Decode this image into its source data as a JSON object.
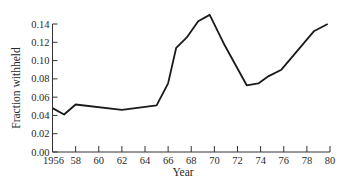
{
  "chart_data": {
    "type": "line",
    "title": "",
    "xlabel": "Year",
    "ylabel": "Fraction withheld",
    "xlim": [
      1956,
      1980
    ],
    "ylim": [
      0.0,
      0.14
    ],
    "grid": false,
    "legend": null,
    "x_ticks": [
      1956,
      1958,
      1960,
      1962,
      1964,
      1966,
      1968,
      1970,
      1972,
      1974,
      1976,
      1978,
      1980
    ],
    "x_tick_labels": [
      "1956",
      "58",
      "60",
      "62",
      "64",
      "66",
      "68",
      "70",
      "72",
      "74",
      "76",
      "78",
      "80"
    ],
    "y_ticks": [
      0.0,
      0.02,
      0.04,
      0.06,
      0.08,
      0.1,
      0.12,
      0.14
    ],
    "y_tick_labels": [
      "0.00",
      "0.02",
      "0.04",
      "0.06",
      "0.08",
      "0.10",
      "0.12",
      "0.14"
    ],
    "series": [
      {
        "name": "Fraction withheld",
        "color": "#1a1a1a",
        "x": [
          1956,
          1957,
          1958,
          1962,
          1965,
          1966,
          1966.7,
          1967.6,
          1968.6,
          1969.6,
          1970.8,
          1972.8,
          1973.8,
          1974.7,
          1975.8,
          1978.6,
          1979.8
        ],
        "y": [
          0.048,
          0.041,
          0.052,
          0.046,
          0.051,
          0.075,
          0.114,
          0.125,
          0.143,
          0.15,
          0.119,
          0.073,
          0.075,
          0.083,
          0.09,
          0.132,
          0.14
        ]
      }
    ]
  },
  "axes": {
    "x_title": "Year",
    "y_title": "Fraction withheld"
  }
}
